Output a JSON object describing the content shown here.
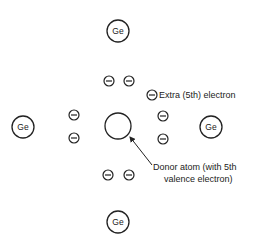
{
  "diagram": {
    "atoms": [
      {
        "id": "ge-top",
        "label": "Ge",
        "cx": 118,
        "cy": 31,
        "r": 11
      },
      {
        "id": "ge-left",
        "label": "Ge",
        "cx": 23,
        "cy": 127,
        "r": 11
      },
      {
        "id": "ge-right",
        "label": "Ge",
        "cx": 211,
        "cy": 127,
        "r": 11
      },
      {
        "id": "ge-bottom",
        "label": "Ge",
        "cx": 118,
        "cy": 222,
        "r": 11
      },
      {
        "id": "donor",
        "label": "",
        "cx": 118,
        "cy": 126,
        "r": 13
      }
    ],
    "electrons": [
      {
        "cx": 109,
        "cy": 81
      },
      {
        "cx": 129,
        "cy": 81
      },
      {
        "cx": 74,
        "cy": 115
      },
      {
        "cx": 74,
        "cy": 138
      },
      {
        "cx": 163,
        "cy": 116
      },
      {
        "cx": 163,
        "cy": 139
      },
      {
        "cx": 108,
        "cy": 175
      },
      {
        "cx": 129,
        "cy": 175
      },
      {
        "cx": 152,
        "cy": 95
      }
    ],
    "labels": {
      "extra_electron": "Extra (5th) electron",
      "donor_line1": "Donor atom (with 5th",
      "donor_line2": "valence electron)"
    },
    "colors": {
      "stroke": "#222222",
      "background": "#ffffff"
    }
  }
}
